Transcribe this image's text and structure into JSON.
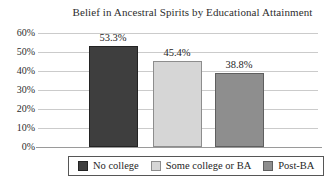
{
  "title": "Belief in Ancestral Spirits by Educational Attainment",
  "chart_data": {
    "type": "bar",
    "title": "Belief in Ancestral Spirits by Educational Attainment",
    "categories": [
      "No college",
      "Some college or BA",
      "Post-BA"
    ],
    "values": [
      53.3,
      45.4,
      38.8
    ],
    "value_labels": [
      "53.3%",
      "45.4%",
      "38.8%"
    ],
    "xlabel": "",
    "ylabel": "",
    "ylim": [
      0,
      60
    ],
    "ytick_step": 10,
    "ytick_labels": [
      "0%",
      "10%",
      "20%",
      "30%",
      "40%",
      "50%",
      "60%"
    ],
    "grid": true,
    "legend_position": "bottom",
    "bar_colors": [
      "#3e3e3e",
      "#d6d6d6",
      "#8e8e8e"
    ],
    "bar_border_colors": [
      "#232323",
      "#8d8d8d",
      "#5f5f5f"
    ]
  },
  "colors": {
    "background": "#ffffff",
    "gridline": "#cbcbcb",
    "axis": "#9a9a9a",
    "text": "#2d2d2d",
    "legend_border": "#565656"
  }
}
